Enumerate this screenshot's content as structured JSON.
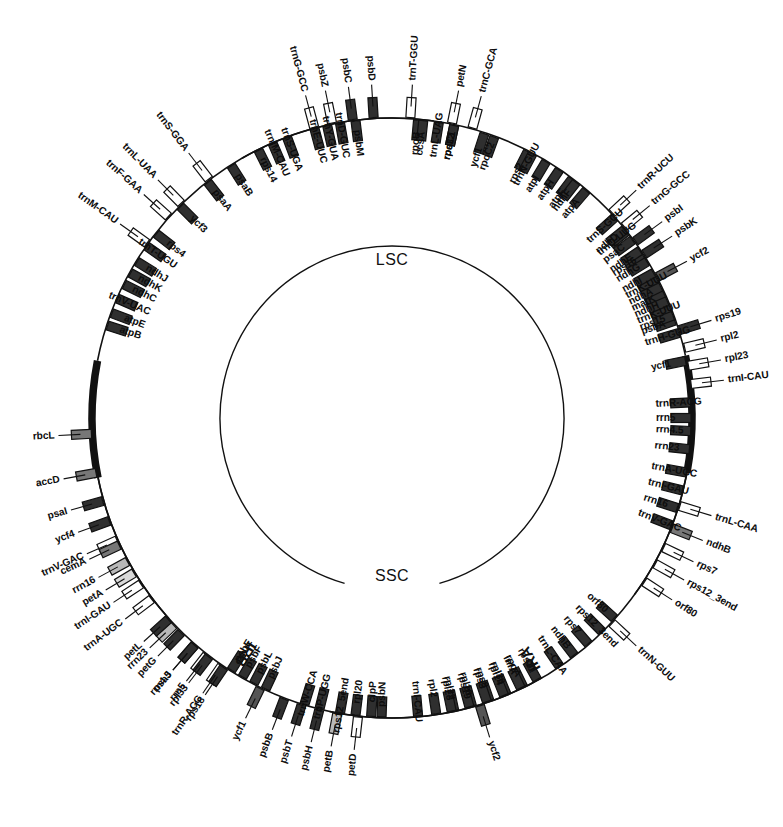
{
  "figure": {
    "type": "circular-genome-map",
    "background_color": "#ffffff",
    "line_color": "#111111"
  },
  "regions": [
    {
      "name": "LSC",
      "label": "LSC",
      "position": "inner-top"
    },
    {
      "name": "SSC",
      "label": "SSC",
      "position": "inner-bottom"
    },
    {
      "name": "IRA",
      "label": "IRA",
      "position": "ring-lower-right"
    },
    {
      "name": "IRB",
      "label": "IRB",
      "position": "ring-lower-left"
    }
  ],
  "palette": {
    "dark": "#2f2f2f",
    "mid_dark": "#555555",
    "mid": "#777777",
    "light_grey": "#b8b8b8",
    "pale": "#d8d8d8",
    "white": "#ffffff",
    "black": "#111111"
  },
  "geometry": {
    "center_x": 392,
    "center_y": 418,
    "backbone_radius": 300,
    "inner_circle_radius": 172,
    "outer_gene_offset": 6,
    "inner_gene_offset": -6
  },
  "genes_outside": [
    {
      "label": "trnM-CAU",
      "angle": 305.5,
      "span": 0,
      "fill": "white",
      "tick": true
    },
    {
      "label": "trnF-GAA",
      "angle": 312.0,
      "span": 0,
      "fill": "white",
      "tick": true
    },
    {
      "label": "trnL-UAA",
      "angle": 315.5,
      "span": 0,
      "fill": "white",
      "tick": true
    },
    {
      "label": "trnS-GGA",
      "angle": 322.5,
      "span": 0,
      "fill": "white",
      "tick": true
    },
    {
      "label": "trnG-GCC",
      "angle": 345.0,
      "span": 0,
      "fill": "white",
      "tick": true
    },
    {
      "label": "psbZ",
      "angle": 348.5,
      "span": 0,
      "fill": "white",
      "tick": true
    },
    {
      "label": "psbC",
      "angle": 352.5,
      "span": 0,
      "fill": "dark",
      "tick": true
    },
    {
      "label": "psbD",
      "angle": 356.5,
      "span": 0,
      "fill": "dark",
      "tick": true
    },
    {
      "label": "trnT-GGU",
      "angle": 3.5,
      "span": 0,
      "fill": "white",
      "tick": true
    },
    {
      "label": "petN",
      "angle": 11.5,
      "span": 0,
      "fill": "white",
      "tick": true
    },
    {
      "label": "trnC-GCA",
      "angle": 15.5,
      "span": 0,
      "fill": "white",
      "tick": true
    },
    {
      "label": "trnR-UCU",
      "angle": 47.0,
      "span": 0,
      "fill": "white",
      "tick": true
    },
    {
      "label": "trnG-GCC",
      "angle": 50.5,
      "span": 0,
      "fill": "white",
      "tick": true
    },
    {
      "label": "psbI",
      "angle": 54.0,
      "span": 0,
      "fill": "dark",
      "tick": true
    },
    {
      "label": "psbK",
      "angle": 57.0,
      "span": 0,
      "fill": "dark",
      "tick": true
    },
    {
      "label": "rps19",
      "angle": 73.0,
      "span": 0,
      "fill": "dark",
      "tick": true
    },
    {
      "label": "rpl2",
      "angle": 76.5,
      "span": 0,
      "fill": "white",
      "tick": true
    },
    {
      "label": "rpl23",
      "angle": 80.0,
      "span": 0,
      "fill": "white",
      "tick": true
    },
    {
      "label": "trnI-CAU",
      "angle": 83.5,
      "span": 0,
      "fill": "white",
      "tick": true
    },
    {
      "label": "trnL-CAA",
      "angle": 107.0,
      "span": 0,
      "fill": "white",
      "tick": true
    },
    {
      "label": "ndhB",
      "angle": 111.5,
      "span": 0,
      "fill": "mid",
      "tick": true
    },
    {
      "label": "rps7",
      "angle": 115.5,
      "span": 0,
      "fill": "white",
      "tick": true
    },
    {
      "label": "rps12_3end",
      "angle": 119.0,
      "span": 0,
      "fill": "white",
      "tick": true
    },
    {
      "label": "orf80",
      "angle": 123.0,
      "span": 0,
      "fill": "white",
      "tick": true
    },
    {
      "label": "trnN-GUU",
      "angle": 133.0,
      "span": 0,
      "fill": "white",
      "tick": true
    },
    {
      "label": "trnR-ACG",
      "angle": 214.5,
      "span": 0,
      "fill": "white",
      "tick": true
    },
    {
      "label": "rrn5",
      "angle": 218.0,
      "span": 0,
      "fill": "white",
      "tick": true
    },
    {
      "label": "rrn4.5",
      "angle": 221.0,
      "span": 0,
      "fill": "white",
      "tick": true
    },
    {
      "label": "rrn23",
      "angle": 226.5,
      "span": 0,
      "fill": "light_grey",
      "tick": true
    },
    {
      "label": "trnA-UGC",
      "angle": 233.0,
      "span": 0,
      "fill": "white",
      "tick": true
    },
    {
      "label": "trnI-GAU",
      "angle": 236.5,
      "span": 0,
      "fill": "white",
      "tick": true
    },
    {
      "label": "rrn16",
      "angle": 241.5,
      "span": 0,
      "fill": "light_grey",
      "tick": true
    },
    {
      "label": "trnV-GAC",
      "angle": 246.0,
      "span": 0,
      "fill": "white",
      "tick": true
    },
    {
      "label": "ycf1",
      "angle": 206.0,
      "span": 0,
      "fill": "mid_dark",
      "tick": true
    },
    {
      "label": "ycf2",
      "angle": 163.0,
      "span": 0,
      "fill": "mid_dark",
      "tick": true
    },
    {
      "label": "ycf2",
      "angle": 62.0,
      "span": 0,
      "fill": "mid_dark",
      "tick": true
    },
    {
      "label": "petD",
      "angle": 186.5,
      "span": 0,
      "fill": "white",
      "tick": true
    },
    {
      "label": "petB",
      "angle": 190.5,
      "span": 0,
      "fill": "light_grey",
      "tick": true
    },
    {
      "label": "psbH",
      "angle": 194.0,
      "span": 0,
      "fill": "dark",
      "tick": true
    },
    {
      "label": "psbT",
      "angle": 197.5,
      "span": 0,
      "fill": "dark",
      "tick": true
    },
    {
      "label": "psbB",
      "angle": 201.0,
      "span": 0,
      "fill": "dark",
      "tick": true
    },
    {
      "label": "rps18",
      "angle": 214.0,
      "span": 0,
      "fill": "dark",
      "tick": true
    },
    {
      "label": "rpl33",
      "angle": 217.5,
      "span": 0,
      "fill": "dark",
      "tick": true
    },
    {
      "label": "psaJ",
      "angle": 221.0,
      "span": 0,
      "fill": "dark",
      "tick": true
    },
    {
      "label": "petG",
      "angle": 224.5,
      "span": 0,
      "fill": "dark",
      "tick": true
    },
    {
      "label": "petL",
      "angle": 228.0,
      "span": 0,
      "fill": "dark",
      "tick": true
    },
    {
      "label": "petA",
      "angle": 239.0,
      "span": 0,
      "fill": "pale",
      "tick": true
    },
    {
      "label": "cemA",
      "angle": 245.0,
      "span": 0,
      "fill": "mid",
      "tick": true
    },
    {
      "label": "ycf4",
      "angle": 250.0,
      "span": 0,
      "fill": "dark",
      "tick": true
    },
    {
      "label": "psaI",
      "angle": 254.0,
      "span": 0,
      "fill": "dark",
      "tick": true
    },
    {
      "label": "accD",
      "angle": 259.5,
      "span": 0,
      "fill": "mid",
      "tick": true
    },
    {
      "label": "rbcL",
      "angle": 267.0,
      "span": 0,
      "fill": "mid",
      "tick": true
    }
  ],
  "genes_inside": [
    {
      "label": "atpB",
      "angle": 288.0
    },
    {
      "label": "atpE",
      "angle": 290.5
    },
    {
      "label": "trnV-UAC",
      "angle": 293.5
    },
    {
      "label": "ndhC",
      "angle": 296.5
    },
    {
      "label": "ndhK",
      "angle": 299.0
    },
    {
      "label": "ndhJ",
      "angle": 301.5
    },
    {
      "label": "trnT-UGU",
      "angle": 305.0
    },
    {
      "label": "rps4",
      "angle": 308.0
    },
    {
      "label": "ycf3",
      "angle": 315.0
    },
    {
      "label": "psaA",
      "angle": 322.0
    },
    {
      "label": "psaB",
      "angle": 327.5
    },
    {
      "label": "rps14",
      "angle": 333.5
    },
    {
      "label": "trnfM-CAU",
      "angle": 336.5
    },
    {
      "label": "trnS-UGA",
      "angle": 339.5
    },
    {
      "label": "trnE-UUC",
      "angle": 345.0
    },
    {
      "label": "trnY-GUA",
      "angle": 347.5
    },
    {
      "label": "trnD-GUC",
      "angle": 350.0
    },
    {
      "label": "psbM",
      "angle": 353.0
    },
    {
      "label": "rpoB",
      "angle": 5.0
    },
    {
      "label": "rpoC1",
      "angle": 12.0
    },
    {
      "label": "rpoC2",
      "angle": 20.0
    },
    {
      "label": "rps2",
      "angle": 27.0
    },
    {
      "label": "atpI",
      "angle": 31.0
    },
    {
      "label": "atpH",
      "angle": 34.0
    },
    {
      "label": "atpF",
      "angle": 37.0
    },
    {
      "label": "atpA",
      "angle": 40.5
    },
    {
      "label": "trnS-GCU",
      "angle": 48.0
    },
    {
      "label": "trnQ-UUG",
      "angle": 51.5
    },
    {
      "label": "rps16",
      "angle": 57.0
    },
    {
      "label": "trnK-UUU",
      "angle": 62.5
    },
    {
      "label": "matK",
      "angle": 65.5
    },
    {
      "label": "trnK-UUU",
      "angle": 68.5
    },
    {
      "label": "psbA",
      "angle": 71.0
    },
    {
      "label": "trnH-GUG",
      "angle": 73.5
    },
    {
      "label": "rpoA",
      "angle": 154.0
    },
    {
      "label": "rps11",
      "angle": 151.0
    },
    {
      "label": "rpl36",
      "angle": 157.5
    },
    {
      "label": "infA",
      "angle": 154.5
    },
    {
      "label": "rps8",
      "angle": 161.0
    },
    {
      "label": "rpl14",
      "angle": 158.0
    },
    {
      "label": "rpl16",
      "angle": 164.5
    },
    {
      "label": "rps3",
      "angle": 161.5
    },
    {
      "label": "rpl22",
      "angle": 168.0
    },
    {
      "label": "rps19",
      "angle": 165.0
    },
    {
      "label": "rpl2",
      "angle": 171.5
    },
    {
      "label": "rpl23",
      "angle": 168.5
    },
    {
      "label": "trnI-CAU",
      "angle": 175.0
    },
    {
      "label": "trnL-CAA",
      "angle": 146.0
    },
    {
      "label": "ndhB",
      "angle": 142.5
    },
    {
      "label": "rps7",
      "angle": 139.0
    },
    {
      "label": "rps12_3end",
      "angle": 135.5
    },
    {
      "label": "orf80",
      "angle": 132.0
    },
    {
      "label": "psbN",
      "angle": 182.0
    },
    {
      "label": "psbJ",
      "angle": 205.0
    },
    {
      "label": "psbL",
      "angle": 207.5
    },
    {
      "label": "psbF",
      "angle": 210.0
    },
    {
      "label": "psbE",
      "angle": 212.5
    },
    {
      "label": "trnW-CCA",
      "angle": 197.0
    },
    {
      "label": "trnP-UGG",
      "angle": 194.0
    },
    {
      "label": "rps12_5end",
      "angle": 190.0
    },
    {
      "label": "rpl20",
      "angle": 187.0
    },
    {
      "label": "clpP",
      "angle": 184.0
    },
    {
      "label": "trnV-GAC",
      "angle": 111.0
    },
    {
      "label": "rrn16",
      "angle": 107.5
    },
    {
      "label": "trnI-GAU",
      "angle": 104.0
    },
    {
      "label": "trnA-UGC",
      "angle": 100.5
    },
    {
      "label": "rrn23",
      "angle": 96.0
    },
    {
      "label": "rrn4.5",
      "angle": 92.5
    },
    {
      "label": "rrn5",
      "angle": 90.0
    },
    {
      "label": "trnR-ACG",
      "angle": 87.0
    },
    {
      "label": "ycf1",
      "angle": 79.0
    },
    {
      "label": "rps15",
      "angle": 70.0
    },
    {
      "label": "ndhH",
      "angle": 67.0
    },
    {
      "label": "ndhA",
      "angle": 64.0
    },
    {
      "label": "ndhI",
      "angle": 61.0
    },
    {
      "label": "ndhG",
      "angle": 58.5
    },
    {
      "label": "ndhE",
      "angle": 56.0
    },
    {
      "label": "psaC",
      "angle": 53.5
    },
    {
      "label": "ndhD",
      "angle": 51.0
    },
    {
      "label": "ndhF",
      "angle": 38.0
    },
    {
      "label": "trnN-GUU",
      "angle": 28.0
    },
    {
      "label": "ycf1",
      "angle": 18.0
    },
    {
      "label": "rps32",
      "angle": 12.0
    },
    {
      "label": "trnL-UAG",
      "angle": 9.0
    },
    {
      "label": "ccsA",
      "angle": 6.0
    }
  ],
  "chart_data": {
    "type": "circular-map",
    "total_outer_genes": 52,
    "total_inner_genes": 86,
    "region_labels": [
      "LSC",
      "SSC",
      "IRA",
      "IRB"
    ]
  }
}
